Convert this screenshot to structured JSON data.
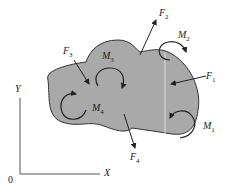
{
  "diagram": {
    "fill_color": "#a9a9a9",
    "outline_color": "#333333",
    "axes": {
      "x_label": "X",
      "y_label": "Y",
      "origin_label": "0"
    },
    "forces": [
      {
        "name": "F",
        "sub": "1"
      },
      {
        "name": "F",
        "sub": "2"
      },
      {
        "name": "F",
        "sub": "3"
      },
      {
        "name": "F",
        "sub": "4"
      }
    ],
    "moments": [
      {
        "name": "M",
        "sub": "1"
      },
      {
        "name": "M",
        "sub": "2"
      },
      {
        "name": "M",
        "sub": "3"
      },
      {
        "name": "M",
        "sub": "4"
      }
    ]
  }
}
